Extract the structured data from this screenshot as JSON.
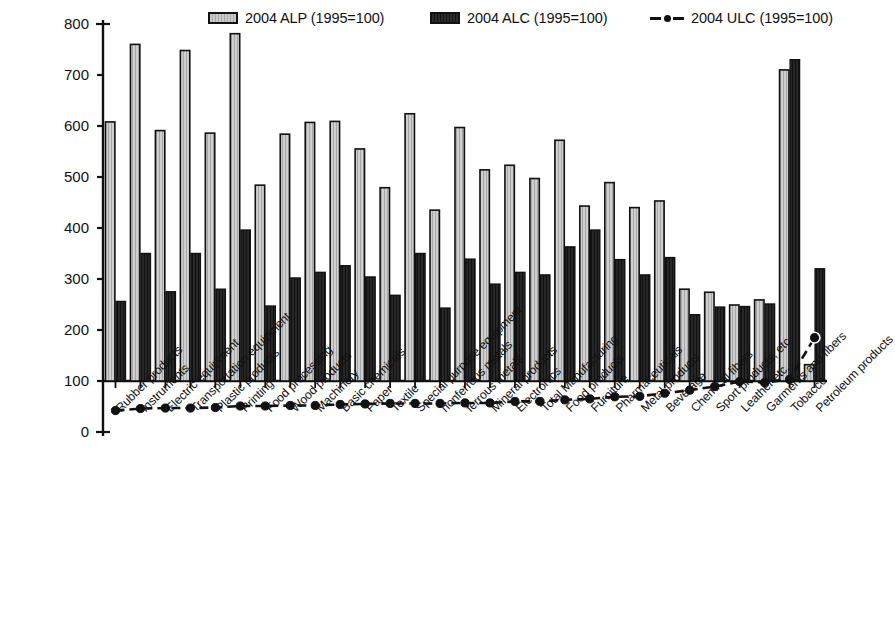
{
  "chart_data": {
    "type": "bar",
    "title": "",
    "subtitle": "",
    "xlabel": "",
    "ylabel": "",
    "ylim": [
      0,
      800
    ],
    "yticks": [
      0,
      100,
      200,
      300,
      400,
      500,
      600,
      700,
      800
    ],
    "grid": false,
    "legend_position": "top",
    "baseline": 100,
    "categories": [
      "Rubber products",
      "Instruments",
      "Electric equipment",
      "Transportation equipment",
      "Plastic products",
      "Printing",
      "Food processing",
      "Wood products",
      "Machinery",
      "Basic chemicals",
      "Paper",
      "Textile",
      "Special purpose equipment",
      "nonferrous metals",
      "ferrous metals",
      "Mineral products",
      "Electronics",
      "Total Manufacturing",
      "Food products",
      "Furniture",
      "Pharmaceuticals",
      "Metal products",
      "Beverage",
      "Chemical fibers",
      "Sport products, etc",
      "Leather etc.",
      "Garments and fibers",
      "Tobacco",
      "Petroleum products"
    ],
    "series": [
      {
        "name": "2004 ALP (1995=100)",
        "type": "bar",
        "color": "#c4c4c4",
        "edge_color": "#111111",
        "values": [
          608,
          760,
          591,
          748,
          586,
          781,
          484,
          584,
          607,
          609,
          555,
          479,
          624,
          435,
          597,
          514,
          523,
          497,
          572,
          443,
          489,
          440,
          453,
          280,
          274,
          249,
          259,
          710,
          132
        ]
      },
      {
        "name": "2004 ALC (1995=100)",
        "type": "bar",
        "color": "#252525",
        "edge_color": "#111111",
        "values": [
          256,
          350,
          275,
          350,
          280,
          396,
          247,
          302,
          313,
          326,
          304,
          268,
          350,
          243,
          339,
          290,
          313,
          308,
          363,
          396,
          338,
          308,
          342,
          230,
          245,
          246,
          251,
          730,
          320
        ]
      },
      {
        "name": "2004 ULC (1995=100)",
        "type": "line",
        "color": "#111111",
        "marker": "circle",
        "linestyle": "dashed",
        "values": [
          42,
          46,
          47,
          47,
          48,
          51,
          51,
          52,
          52,
          54,
          55,
          56,
          56,
          56,
          57,
          57,
          60,
          60,
          63,
          65,
          69,
          70,
          76,
          82,
          89,
          99,
          97,
          103,
          185
        ]
      }
    ],
    "legend": [
      {
        "label": "2004 ALP (1995=100)",
        "marker": "light-gray-bar"
      },
      {
        "label": "2004 ALC (1995=100)",
        "marker": "dark-bar"
      },
      {
        "label": "2004 ULC (1995=100)",
        "marker": "dashed-line-dot"
      }
    ]
  }
}
